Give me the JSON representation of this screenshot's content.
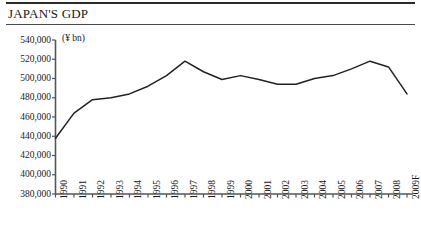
{
  "header": {
    "title": "JAPAN'S GDP"
  },
  "chart_data": {
    "type": "line",
    "title": "JAPAN'S GDP",
    "xlabel": "",
    "ylabel": "",
    "unit_label": "(¥ bn)",
    "grid": false,
    "legend": "none",
    "ylim": [
      380000,
      540000
    ],
    "ytick_step": 20000,
    "yticks": [
      540000,
      520000,
      500000,
      480000,
      460000,
      440000,
      420000,
      400000,
      380000
    ],
    "ytick_labels": [
      "540,000",
      "520,000",
      "500,000",
      "480,000",
      "460,000",
      "440,000",
      "420,000",
      "400,000",
      "380,000"
    ],
    "categories": [
      "1990",
      "1991",
      "1992",
      "1993",
      "1994",
      "1995",
      "1996",
      "1997",
      "1998",
      "1999",
      "2000",
      "2001",
      "2002",
      "2003",
      "2004",
      "2005",
      "2006",
      "2007",
      "2008",
      "2009F"
    ],
    "values": [
      438000,
      464000,
      478000,
      480000,
      484000,
      492000,
      503000,
      518000,
      507000,
      499000,
      503000,
      499000,
      494000,
      494000,
      500000,
      503000,
      510000,
      518000,
      512000,
      484000
    ],
    "series": [
      {
        "name": "GDP",
        "color": "#222222",
        "values": [
          438000,
          464000,
          478000,
          480000,
          484000,
          492000,
          503000,
          518000,
          507000,
          499000,
          503000,
          499000,
          494000,
          494000,
          500000,
          503000,
          510000,
          518000,
          512000,
          484000
        ]
      }
    ]
  },
  "colors": {
    "line": "#222222",
    "axis": "#555555",
    "rule": "#2b2b2b",
    "text": "#1a1a1a"
  }
}
